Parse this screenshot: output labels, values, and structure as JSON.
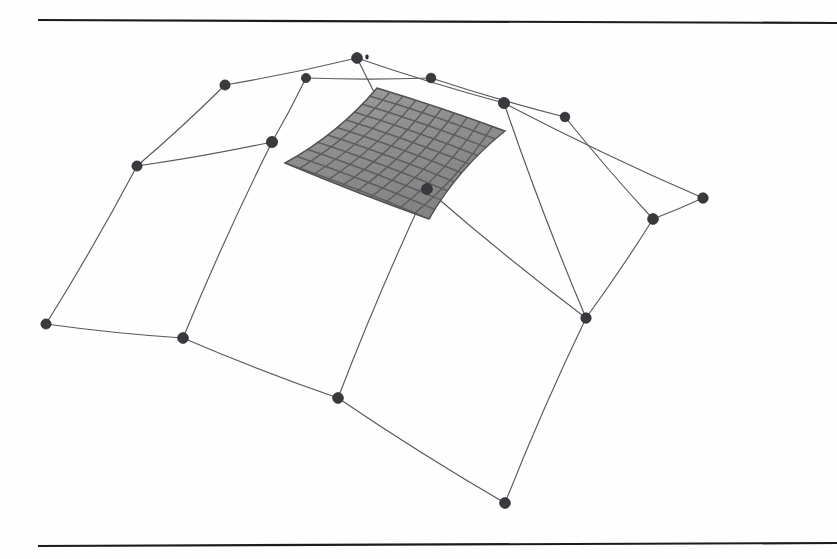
{
  "figure": {
    "kind": "b-spline-surface-with-control-net",
    "background_color": "#fefefe",
    "rule_color": "#1c1c1c",
    "net_line_color": "#59595c",
    "control_point_color": "#3a3a3e",
    "patch_fill_color": "#9b9b9b",
    "patch_grid_color": "#5d5d60"
  },
  "rules": [
    {
      "name": "top-rule",
      "x1": 38,
      "y1": 20,
      "x2": 837,
      "y2": 23
    },
    {
      "name": "bottom-rule",
      "x1": 38,
      "y1": 546,
      "x2": 837,
      "y2": 543
    }
  ],
  "marks": [
    {
      "name": "top-speck",
      "cx": 367,
      "cy": 57,
      "r": 1.6
    },
    {
      "name": "bottom-speck",
      "cx": 506,
      "cy": 503,
      "r": 2.2
    }
  ],
  "chart_data": {
    "type": "scatter",
    "title": "",
    "xlabel": "",
    "ylabel": "",
    "grid": false,
    "legend": "none",
    "xlim": [
      0,
      837
    ],
    "ylim": [
      559,
      0
    ],
    "control_points": [
      {
        "id": "p00",
        "row": 0,
        "col": 0,
        "x": 137,
        "y": 166
      },
      {
        "id": "p01",
        "row": 0,
        "col": 1,
        "x": 225,
        "y": 85
      },
      {
        "id": "p02",
        "row": 0,
        "col": 2,
        "x": 306,
        "y": 78
      },
      {
        "id": "p03",
        "row": 0,
        "col": 3,
        "x": 357,
        "y": 58
      },
      {
        "id": "p04",
        "row": 0,
        "col": 4,
        "x": 431,
        "y": 78
      },
      {
        "id": "p05",
        "row": 0,
        "col": 5,
        "x": 504,
        "y": 103
      },
      {
        "id": "p06",
        "row": 0,
        "col": 6,
        "x": 565,
        "y": 117
      },
      {
        "id": "p07",
        "row": 0,
        "col": 7,
        "x": 703,
        "y": 198
      },
      {
        "id": "p10",
        "row": 1,
        "col": 0,
        "x": 272,
        "y": 142
      },
      {
        "id": "p11",
        "row": 1,
        "col": 1,
        "x": 427,
        "y": 189
      },
      {
        "id": "p12",
        "row": 1,
        "col": 2,
        "x": 653,
        "y": 219
      },
      {
        "id": "p13",
        "row": 1,
        "col": 3,
        "x": 586,
        "y": 318
      },
      {
        "id": "p20",
        "row": 2,
        "col": 0,
        "x": 46,
        "y": 324
      },
      {
        "id": "p21",
        "row": 2,
        "col": 1,
        "x": 183,
        "y": 338
      },
      {
        "id": "p22",
        "row": 2,
        "col": 2,
        "x": 338,
        "y": 398
      },
      {
        "id": "p23",
        "row": 2,
        "col": 3,
        "x": 505,
        "y": 503
      }
    ],
    "net_edges": [
      {
        "from": "p20",
        "to": "p00"
      },
      {
        "from": "p00",
        "to": "p01"
      },
      {
        "from": "p01",
        "to": "p03"
      },
      {
        "from": "p03",
        "to": "p05"
      },
      {
        "from": "p05",
        "to": "p07"
      },
      {
        "from": "p00",
        "to": "p10"
      },
      {
        "from": "p10",
        "to": "p02"
      },
      {
        "from": "p02",
        "to": "p04"
      },
      {
        "from": "p04",
        "to": "p06"
      },
      {
        "from": "p06",
        "to": "p12"
      },
      {
        "from": "p03",
        "to": "p11"
      },
      {
        "from": "p11",
        "to": "p22"
      },
      {
        "from": "p10",
        "to": "p21"
      },
      {
        "from": "p20",
        "to": "p21"
      },
      {
        "from": "p21",
        "to": "p22"
      },
      {
        "from": "p22",
        "to": "p23"
      },
      {
        "from": "p05",
        "to": "p13"
      },
      {
        "from": "p11",
        "to": "p13"
      },
      {
        "from": "p13",
        "to": "p12"
      },
      {
        "from": "p12",
        "to": "p07"
      },
      {
        "from": "p13",
        "to": "p23"
      }
    ],
    "surface_patch": {
      "name": "shaded-bspline-patch",
      "corners": [
        {
          "label": "upper-left",
          "x": 285,
          "y": 163
        },
        {
          "label": "upper-right",
          "x": 377,
          "y": 88
        },
        {
          "label": "lower-right",
          "x": 505,
          "y": 131
        },
        {
          "label": "lower-left",
          "x": 429,
          "y": 219
        }
      ],
      "iso_rows": 10,
      "iso_cols": 10,
      "fill": "#9b9b9b"
    }
  }
}
